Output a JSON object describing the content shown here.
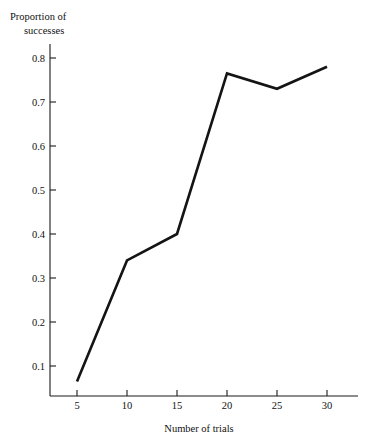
{
  "chart_data": {
    "type": "line",
    "title": "",
    "ylabel": "Proportion of successes",
    "ylabel_lines": [
      "Proportion of",
      "successes"
    ],
    "xlabel": "Number of trials",
    "x": [
      5,
      10,
      15,
      20,
      25,
      30
    ],
    "values": [
      0.065,
      0.34,
      0.4,
      0.765,
      0.73,
      0.78
    ],
    "series": [
      {
        "name": "Proportion of successes",
        "values": [
          0.065,
          0.34,
          0.4,
          0.765,
          0.73,
          0.78
        ]
      }
    ],
    "xtick_labels": [
      "5",
      "10",
      "15",
      "20",
      "25",
      "30"
    ],
    "ytick_labels": [
      "0.1",
      "0.2",
      "0.3",
      "0.4",
      "0.5",
      "0.6",
      "0.7",
      "0.8"
    ],
    "ytick_values": [
      0.1,
      0.2,
      0.3,
      0.4,
      0.5,
      0.6,
      0.7,
      0.8
    ],
    "xlim": [
      2.5,
      32.5
    ],
    "ylim": [
      0.0,
      0.845
    ],
    "grid": false,
    "legend": false,
    "line_color": "#141414",
    "axis_color": "#1a1a1a"
  }
}
